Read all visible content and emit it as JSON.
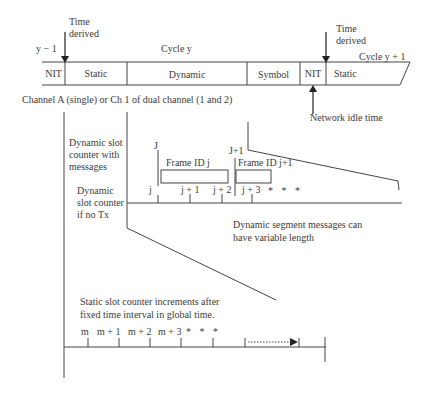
{
  "timeline": {
    "prev_cycle": "y − 1",
    "cycle_label": "Cycle y",
    "next_cycle_label": "Cycle y + 1",
    "time_derived_left": [
      "Time",
      "derived"
    ],
    "time_derived_right": [
      "Time",
      "derived"
    ],
    "segments": [
      {
        "label": "NIT"
      },
      {
        "label": "Static"
      },
      {
        "label": "Dynamic"
      },
      {
        "label": "Symbol"
      },
      {
        "label": "NIT"
      },
      {
        "label": "Static"
      }
    ],
    "network_idle_time": "Network idle time",
    "channel_caption": "Channel A (single) or Ch 1 of dual channel (1 and 2)"
  },
  "dynamic_detail": {
    "with_messages_label": [
      "Dynamic slot",
      "counter with",
      "messages"
    ],
    "no_tx_label": [
      "Dynamic",
      "slot counter",
      "if no Tx"
    ],
    "upper_marks": [
      "J",
      "J+1"
    ],
    "frames": [
      "Frame ID j",
      "Frame ID j+1"
    ],
    "lower_ticks": [
      "j",
      "j + 1",
      "j + 2",
      "j + 3"
    ],
    "ellipsis": "* * *",
    "note": [
      "Dynamic segment messages can",
      "have variable length"
    ]
  },
  "static_detail": {
    "note": [
      "Static slot counter increments after",
      "fixed time interval in global time."
    ],
    "ticks": [
      "m",
      "m + 1",
      "m + 2",
      "m + 3"
    ],
    "ellipsis": "* * *"
  },
  "colors": {
    "line": "#444444",
    "text": "#3a3a3a"
  }
}
